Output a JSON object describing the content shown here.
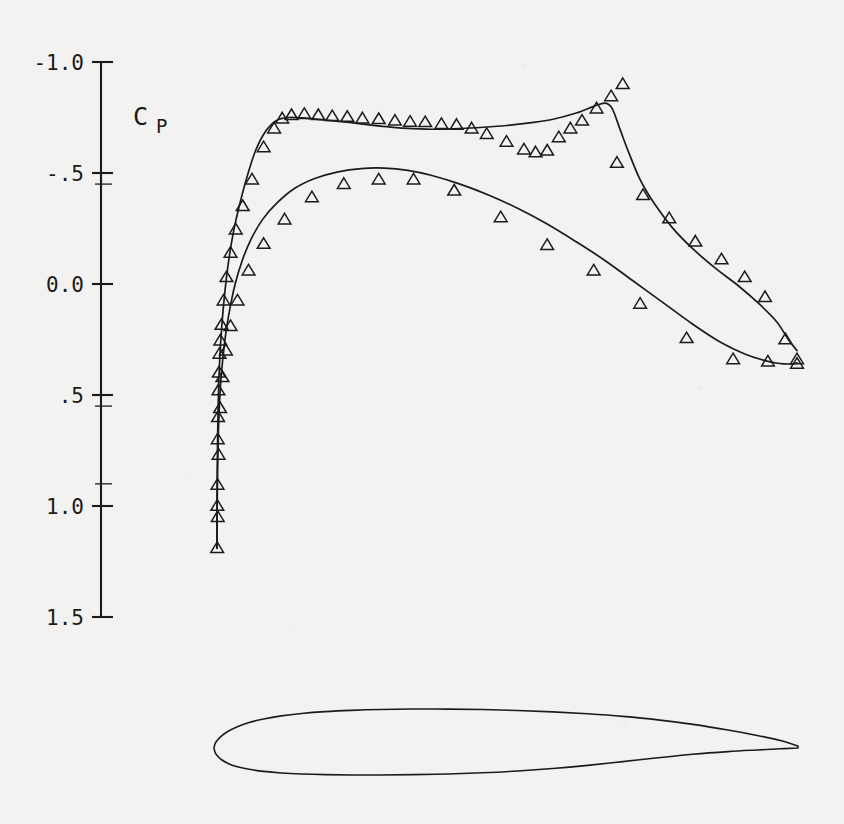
{
  "figure": {
    "background_color": "#f3f2f0",
    "ink_color": "#1b1b1b",
    "axis_title": "C",
    "axis_title_subscript": "P"
  },
  "chart_data": {
    "type": "scatter",
    "title": "",
    "subtitle": "",
    "xlabel": "",
    "ylabel": "C_P",
    "grid": false,
    "legend": null,
    "x_axis_visible": false,
    "xlim": [
      0.0,
      1.0
    ],
    "ylim": [
      1.5,
      -1.0
    ],
    "y_axis_inverted": true,
    "yticks": [
      -1.0,
      -0.5,
      0.0,
      0.5,
      1.0,
      1.5
    ],
    "ytick_labels": [
      "-1.0",
      "-.5",
      "0.0",
      ".5",
      "1.0",
      "1.5"
    ],
    "minor_yticks": [
      -0.45,
      0.55,
      0.9
    ],
    "marker": "triangle-up-open",
    "series": [
      {
        "name": "upper-surface-measured",
        "role": "scatter",
        "marker": "triangle-up-open",
        "points": [
          [
            0.002,
            1.19
          ],
          [
            0.0022,
            1.0
          ],
          [
            0.0026,
            0.905
          ],
          [
            0.003,
            0.7
          ],
          [
            0.0036,
            0.6
          ],
          [
            0.0042,
            0.48
          ],
          [
            0.005,
            0.4
          ],
          [
            0.006,
            0.315
          ],
          [
            0.0075,
            0.255
          ],
          [
            0.0095,
            0.185
          ],
          [
            0.013,
            0.075
          ],
          [
            0.018,
            -0.03
          ],
          [
            0.025,
            -0.14
          ],
          [
            0.034,
            -0.245
          ],
          [
            0.046,
            -0.35
          ],
          [
            0.062,
            -0.47
          ],
          [
            0.082,
            -0.615
          ],
          [
            0.1,
            -0.7
          ],
          [
            0.114,
            -0.745
          ],
          [
            0.13,
            -0.76
          ],
          [
            0.152,
            -0.765
          ],
          [
            0.176,
            -0.76
          ],
          [
            0.2,
            -0.755
          ],
          [
            0.226,
            -0.752
          ],
          [
            0.252,
            -0.745
          ],
          [
            0.28,
            -0.742
          ],
          [
            0.308,
            -0.735
          ],
          [
            0.334,
            -0.73
          ],
          [
            0.36,
            -0.728
          ],
          [
            0.388,
            -0.72
          ],
          [
            0.414,
            -0.716
          ],
          [
            0.44,
            -0.7
          ],
          [
            0.466,
            -0.675
          ],
          [
            0.5,
            -0.64
          ],
          [
            0.53,
            -0.605
          ],
          [
            0.55,
            -0.592
          ],
          [
            0.57,
            -0.6
          ],
          [
            0.59,
            -0.66
          ],
          [
            0.61,
            -0.7
          ],
          [
            0.63,
            -0.735
          ],
          [
            0.655,
            -0.79
          ],
          [
            0.68,
            -0.845
          ],
          [
            0.7,
            -0.9
          ],
          [
            0.69,
            -0.545
          ],
          [
            0.735,
            -0.4
          ],
          [
            0.78,
            -0.295
          ],
          [
            0.825,
            -0.19
          ],
          [
            0.87,
            -0.11
          ],
          [
            0.91,
            -0.03
          ],
          [
            0.945,
            0.06
          ],
          [
            0.98,
            0.25
          ],
          [
            1.0,
            0.34
          ]
        ]
      },
      {
        "name": "lower-surface-measured",
        "role": "scatter",
        "marker": "triangle-up-open",
        "points": [
          [
            0.003,
            1.05
          ],
          [
            0.0045,
            0.77
          ],
          [
            0.007,
            0.56
          ],
          [
            0.011,
            0.42
          ],
          [
            0.017,
            0.3
          ],
          [
            0.025,
            0.19
          ],
          [
            0.037,
            0.075
          ],
          [
            0.056,
            -0.06
          ],
          [
            0.082,
            -0.18
          ],
          [
            0.118,
            -0.29
          ],
          [
            0.165,
            -0.39
          ],
          [
            0.22,
            -0.45
          ],
          [
            0.28,
            -0.47
          ],
          [
            0.34,
            -0.47
          ],
          [
            0.41,
            -0.42
          ],
          [
            0.49,
            -0.3
          ],
          [
            0.57,
            -0.175
          ],
          [
            0.65,
            -0.06
          ],
          [
            0.73,
            0.09
          ],
          [
            0.81,
            0.245
          ],
          [
            0.89,
            0.34
          ],
          [
            0.95,
            0.35
          ],
          [
            1.0,
            0.36
          ]
        ]
      },
      {
        "name": "upper-surface-computed",
        "role": "line",
        "points": [
          [
            0.0016,
            1.19
          ],
          [
            0.0018,
            0.98
          ],
          [
            0.0022,
            0.83
          ],
          [
            0.0028,
            0.69
          ],
          [
            0.0036,
            0.56
          ],
          [
            0.0048,
            0.44
          ],
          [
            0.0064,
            0.34
          ],
          [
            0.0086,
            0.24
          ],
          [
            0.0115,
            0.14
          ],
          [
            0.0155,
            0.03
          ],
          [
            0.021,
            -0.09
          ],
          [
            0.029,
            -0.22
          ],
          [
            0.039,
            -0.34
          ],
          [
            0.052,
            -0.47
          ],
          [
            0.068,
            -0.6
          ],
          [
            0.086,
            -0.69
          ],
          [
            0.105,
            -0.738
          ],
          [
            0.125,
            -0.75
          ],
          [
            0.15,
            -0.748
          ],
          [
            0.18,
            -0.74
          ],
          [
            0.22,
            -0.73
          ],
          [
            0.26,
            -0.718
          ],
          [
            0.3,
            -0.707
          ],
          [
            0.34,
            -0.7
          ],
          [
            0.38,
            -0.697
          ],
          [
            0.42,
            -0.7
          ],
          [
            0.46,
            -0.706
          ],
          [
            0.5,
            -0.714
          ],
          [
            0.54,
            -0.726
          ],
          [
            0.58,
            -0.742
          ],
          [
            0.62,
            -0.77
          ],
          [
            0.65,
            -0.8
          ],
          [
            0.67,
            -0.815
          ],
          [
            0.682,
            -0.79
          ],
          [
            0.695,
            -0.7
          ],
          [
            0.71,
            -0.595
          ],
          [
            0.73,
            -0.47
          ],
          [
            0.755,
            -0.36
          ],
          [
            0.785,
            -0.255
          ],
          [
            0.82,
            -0.16
          ],
          [
            0.86,
            -0.07
          ],
          [
            0.9,
            0.01
          ],
          [
            0.935,
            0.09
          ],
          [
            0.965,
            0.17
          ],
          [
            0.985,
            0.25
          ],
          [
            1.0,
            0.3
          ]
        ]
      },
      {
        "name": "lower-surface-computed",
        "role": "line",
        "points": [
          [
            0.0016,
            1.19
          ],
          [
            0.002,
            1.01
          ],
          [
            0.0028,
            0.83
          ],
          [
            0.0042,
            0.66
          ],
          [
            0.006,
            0.54
          ],
          [
            0.0085,
            0.43
          ],
          [
            0.012,
            0.33
          ],
          [
            0.017,
            0.22
          ],
          [
            0.024,
            0.11
          ],
          [
            0.033,
            0.0
          ],
          [
            0.045,
            -0.105
          ],
          [
            0.06,
            -0.2
          ],
          [
            0.08,
            -0.29
          ],
          [
            0.105,
            -0.365
          ],
          [
            0.135,
            -0.43
          ],
          [
            0.17,
            -0.475
          ],
          [
            0.21,
            -0.505
          ],
          [
            0.25,
            -0.52
          ],
          [
            0.29,
            -0.522
          ],
          [
            0.33,
            -0.512
          ],
          [
            0.37,
            -0.49
          ],
          [
            0.42,
            -0.45
          ],
          [
            0.47,
            -0.4
          ],
          [
            0.52,
            -0.34
          ],
          [
            0.57,
            -0.27
          ],
          [
            0.62,
            -0.19
          ],
          [
            0.67,
            -0.105
          ],
          [
            0.72,
            -0.01
          ],
          [
            0.77,
            0.085
          ],
          [
            0.82,
            0.18
          ],
          [
            0.87,
            0.265
          ],
          [
            0.91,
            0.315
          ],
          [
            0.945,
            0.345
          ],
          [
            0.97,
            0.358
          ],
          [
            0.99,
            0.36
          ],
          [
            1.0,
            0.355
          ]
        ]
      }
    ],
    "airfoil": {
      "name": "airfoil-section",
      "chord_line_y": 0.0,
      "upper": [
        [
          0.0,
          0.0
        ],
        [
          0.002,
          0.009
        ],
        [
          0.006,
          0.0155
        ],
        [
          0.013,
          0.0235
        ],
        [
          0.025,
          0.033
        ],
        [
          0.04,
          0.0415
        ],
        [
          0.06,
          0.0495
        ],
        [
          0.085,
          0.0565
        ],
        [
          0.115,
          0.0625
        ],
        [
          0.15,
          0.0672
        ],
        [
          0.19,
          0.0708
        ],
        [
          0.235,
          0.0733
        ],
        [
          0.285,
          0.075
        ],
        [
          0.34,
          0.0758
        ],
        [
          0.4,
          0.0757
        ],
        [
          0.46,
          0.0748
        ],
        [
          0.52,
          0.073
        ],
        [
          0.58,
          0.0703
        ],
        [
          0.64,
          0.0665
        ],
        [
          0.7,
          0.0615
        ],
        [
          0.76,
          0.0548
        ],
        [
          0.82,
          0.046
        ],
        [
          0.88,
          0.035
        ],
        [
          0.93,
          0.0245
        ],
        [
          0.97,
          0.0145
        ],
        [
          1.0,
          0.004
        ]
      ],
      "lower": [
        [
          0.0,
          0.0
        ],
        [
          0.002,
          -0.009
        ],
        [
          0.006,
          -0.0155
        ],
        [
          0.013,
          -0.0228
        ],
        [
          0.025,
          -0.0305
        ],
        [
          0.04,
          -0.0365
        ],
        [
          0.06,
          -0.0415
        ],
        [
          0.085,
          -0.0455
        ],
        [
          0.115,
          -0.0485
        ],
        [
          0.15,
          -0.0505
        ],
        [
          0.19,
          -0.0518
        ],
        [
          0.235,
          -0.0525
        ],
        [
          0.285,
          -0.0525
        ],
        [
          0.34,
          -0.0518
        ],
        [
          0.4,
          -0.0505
        ],
        [
          0.46,
          -0.0482
        ],
        [
          0.52,
          -0.0448
        ],
        [
          0.58,
          -0.04
        ],
        [
          0.64,
          -0.0338
        ],
        [
          0.7,
          -0.0265
        ],
        [
          0.76,
          -0.019
        ],
        [
          0.82,
          -0.0122
        ],
        [
          0.88,
          -0.007
        ],
        [
          0.93,
          -0.0038
        ],
        [
          0.97,
          -0.0015
        ],
        [
          1.0,
          0.0
        ]
      ]
    }
  }
}
